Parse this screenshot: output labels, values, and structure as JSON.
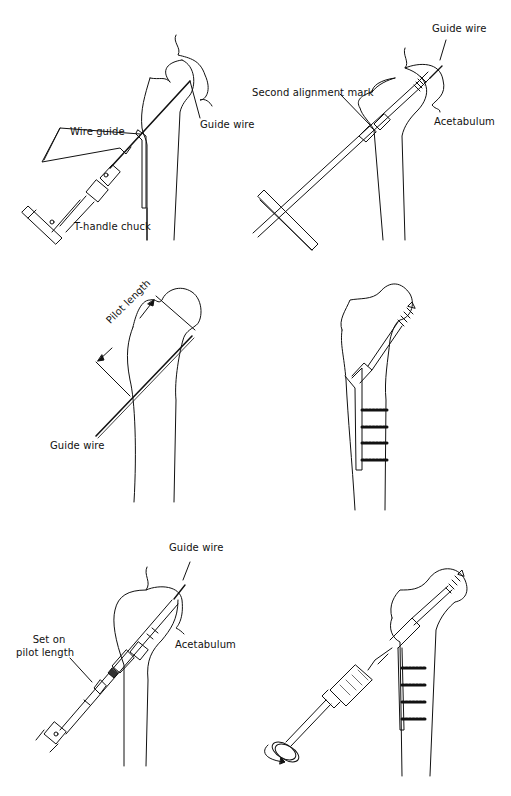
{
  "figure": {
    "panels": [
      {
        "id": "top-left",
        "labels": {
          "wire_guide": "Wire guide",
          "guide_wire": "Guide wire",
          "t_handle_chuck": "T-handle chuck"
        }
      },
      {
        "id": "top-right",
        "labels": {
          "guide_wire": "Guide wire",
          "second_alignment_mark": "Second alignment mark",
          "acetabulum": "Acetabulum"
        }
      },
      {
        "id": "middle-left",
        "labels": {
          "pilot_length": "Pilot length",
          "guide_wire": "Guide wire"
        }
      },
      {
        "id": "middle-right",
        "labels": {}
      },
      {
        "id": "bottom-left",
        "labels": {
          "guide_wire": "Guide wire",
          "set_on_line1": "Set on",
          "set_on_line2": "pilot length",
          "acetabulum": "Acetabulum"
        }
      },
      {
        "id": "bottom-right",
        "labels": {}
      }
    ]
  }
}
